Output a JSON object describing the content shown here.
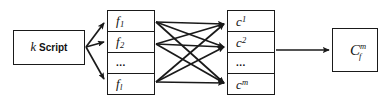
{
  "diagram": {
    "stroke_color": "#1a1a1a",
    "background_color": "#ffffff",
    "nodes": {
      "script": {
        "name": "script-box",
        "symbol": "k",
        "label": "Script"
      },
      "features": {
        "name": "feature-stack",
        "cells": [
          {
            "base": "f",
            "sub": "1"
          },
          {
            "base": "f",
            "sub": "2"
          },
          {
            "base": "...",
            "sub": ""
          },
          {
            "base": "f",
            "sub": "l"
          }
        ]
      },
      "classes": {
        "name": "class-stack",
        "cells": [
          {
            "base": "c",
            "sup": "1"
          },
          {
            "base": "c",
            "sup": "2"
          },
          {
            "base": "...",
            "sup": ""
          },
          {
            "base": "c",
            "sup": "m"
          }
        ]
      },
      "result": {
        "name": "result-box",
        "base": "C",
        "sup": "m",
        "sub": "f"
      }
    },
    "edges": {
      "script_to_features": 3,
      "features_to_classes": 9,
      "classes_to_result": 1
    }
  }
}
